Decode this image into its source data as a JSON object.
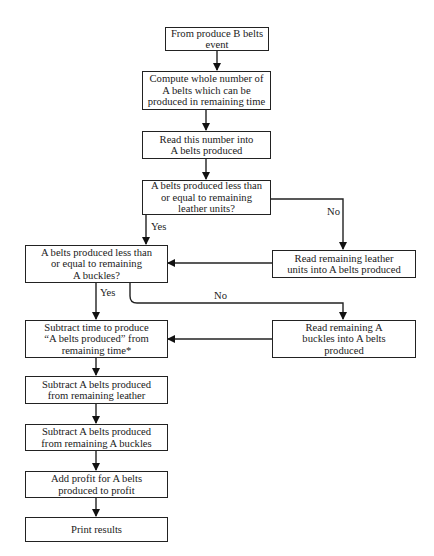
{
  "flowchart": {
    "nodes": {
      "start": "From produce B belts event",
      "compute": "Compute whole number of\nA belts which can be\nproduced in remaining time",
      "read_number": "Read this number into\nA belts produced",
      "check_leather": "A belts produced less than\nor equal to remaining\nleather units?",
      "read_leather": "Read remaining leather\nunits into A belts produced",
      "check_buckles": "A belts produced less than\nor equal to remaining\nA buckles?",
      "read_buckles": "Read remaining A\nbuckles into A belts\nproduced",
      "subtract_time": "Subtract time to produce\n“A belts produced” from\nremaining time*",
      "subtract_leather": "Subtract A belts produced\nfrom remaining leather",
      "subtract_buckles": "Subtract A belts produced\nfrom remaining A buckles",
      "add_profit": "Add profit for A belts\nproduced to profit",
      "print": "Print results"
    },
    "edge_labels": {
      "leather_yes": "Yes",
      "leather_no": "No",
      "buckles_yes": "Yes",
      "buckles_no": "No"
    }
  }
}
